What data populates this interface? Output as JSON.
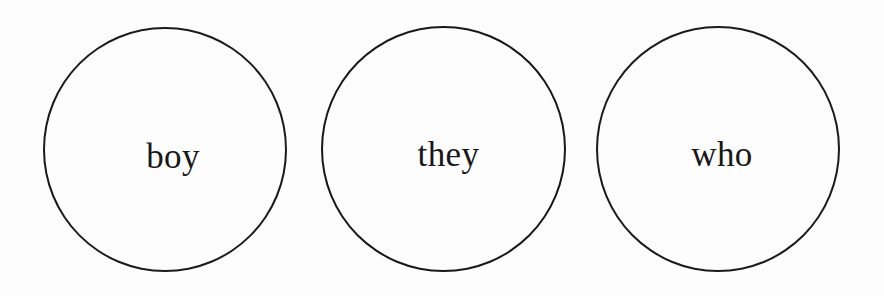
{
  "page": {
    "background_color": "#fdfdfd",
    "width": 884,
    "height": 296
  },
  "style": {
    "stroke_color": "#1b1b1d",
    "text_color": "#18181a",
    "stroke_width_px": 2
  },
  "circles": [
    {
      "id": "boy",
      "word": "boy",
      "center_x": 165,
      "center_y": 150,
      "diameter": 244
    },
    {
      "id": "they",
      "word": "they",
      "center_x": 443,
      "center_y": 149,
      "diameter": 245
    },
    {
      "id": "who",
      "word": "who",
      "center_x": 718,
      "center_y": 149,
      "diameter": 244
    }
  ]
}
